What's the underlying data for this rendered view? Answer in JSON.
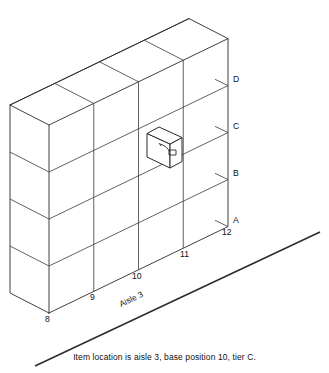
{
  "diagram": {
    "type": "isometric-rack",
    "caption": "Item location is aisle 3, base position 10, tier C.",
    "aisle_label": "Aisle 3",
    "tiers": [
      {
        "label": "D",
        "index": 4
      },
      {
        "label": "C",
        "index": 3
      },
      {
        "label": "B",
        "index": 2
      },
      {
        "label": "A",
        "index": 1
      }
    ],
    "base_positions": [
      {
        "label": "8"
      },
      {
        "label": "9"
      },
      {
        "label": "10"
      },
      {
        "label": "11"
      },
      {
        "label": "12"
      }
    ],
    "highlighted_item": {
      "base_position": "10",
      "tier": "C",
      "aisle": "3",
      "description": "carton protruding from rack"
    },
    "colors": {
      "line": "#2b2b2b",
      "fill": "#ffffff",
      "text": "#111111",
      "background": "#ffffff"
    },
    "counts": {
      "bays": 4,
      "tiers": 4
    }
  }
}
